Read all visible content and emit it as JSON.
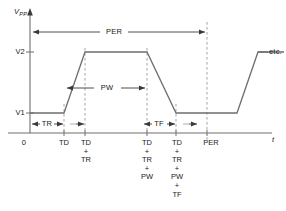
{
  "figure": {
    "type": "pulse-waveform-timing-diagram",
    "axes": {
      "y_axis_label": "V",
      "y_axis_label_subscript": "PP",
      "x_axis_label": "t",
      "origin_label": "0",
      "y_ticks": [
        {
          "label": "V2",
          "y_px": 52
        },
        {
          "label": "V1",
          "y_px": 113
        }
      ],
      "x_ticks": [
        {
          "lines": [
            "TD"
          ],
          "x_px": 64
        },
        {
          "lines": [
            "TD",
            "+",
            "TR"
          ],
          "x_px": 85
        },
        {
          "lines": [
            "TD",
            "+",
            "TR",
            "+",
            "PW"
          ],
          "x_px": 147
        },
        {
          "lines": [
            "TD",
            "+",
            "TR",
            "+",
            "PW",
            "+",
            "TF"
          ],
          "x_px": 176
        },
        {
          "lines": [
            "PER"
          ],
          "x_px": 207
        }
      ]
    },
    "dimension_labels": {
      "period": "PER",
      "pulse_width": "PW",
      "time_rise": "TR",
      "time_fall": "TF"
    },
    "annotations": {
      "continuation": "etc."
    },
    "colors": {
      "trace": "#6e6e6e",
      "axis": "#6e6e6e",
      "dashed": "#9a9a9a",
      "text": "#1a1a1a",
      "background": "#ffffff"
    },
    "waveform": {
      "description": "Trapezoidal pulse train: flat at V1 from origin to TD, rises to V2 over TR, holds for PW, falls to V1 over TF, holds to PER, then repeats.",
      "points_px": [
        [
          30,
          113
        ],
        [
          64,
          113
        ],
        [
          85,
          52
        ],
        [
          147,
          52
        ],
        [
          176,
          113
        ],
        [
          207,
          113
        ],
        [
          237,
          113
        ],
        [
          258,
          52
        ],
        [
          286,
          52
        ]
      ]
    }
  }
}
